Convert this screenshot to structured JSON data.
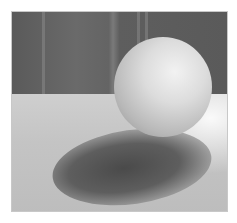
{
  "image": {
    "subject": "white sphere on a table casting a shadow",
    "colors": {
      "wall": "#5e5e5e",
      "table": "#c8c8c8",
      "sphere_highlight": "#f2f2f2",
      "sphere_shade": "#8e8e8e",
      "shadow": "#4a4a4a",
      "border": "#c8c8c8",
      "background": "#ffffff"
    }
  }
}
